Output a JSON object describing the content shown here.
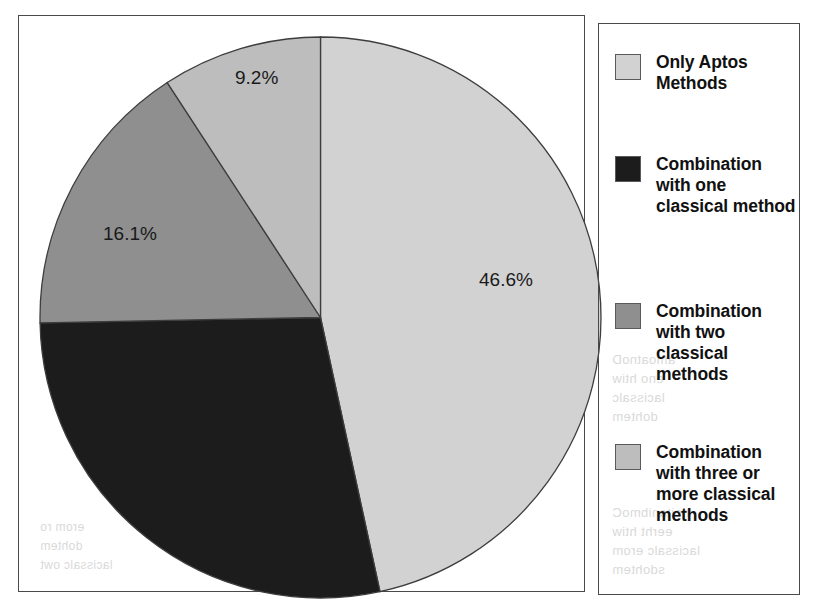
{
  "chart_data": {
    "type": "pie",
    "title": "",
    "subtitle": "",
    "xlabel": "",
    "ylabel": "",
    "grid": false,
    "legend_position": "right",
    "start_angle_deg": 0,
    "direction": "clockwise",
    "categories": [
      "Only Aptos Methods",
      "Combination with one classical method",
      "Combination with two classical methods",
      "Combination with three or more classical methods"
    ],
    "values": [
      46.6,
      28.1,
      16.1,
      9.2
    ],
    "value_labels": [
      "46.6%",
      "28.1%",
      "16.1%",
      "9.2%"
    ],
    "visible_value_labels": [
      "46.6%",
      "16.1%",
      "9.2%"
    ],
    "colors": [
      "#d2d2d2",
      "#1c1c1c",
      "#8f8f8f",
      "#bdbdbd"
    ],
    "units": "percent"
  },
  "pie": {
    "slices": [
      {
        "name": "only-aptos-methods",
        "label": "46.6%",
        "value": 46.6,
        "color": "#d2d2d2",
        "label_x": 460,
        "label_y": 253
      },
      {
        "name": "combination-one-classical",
        "label": "",
        "value": 28.1,
        "color": "#1c1c1c",
        "label_x": 0,
        "label_y": 0
      },
      {
        "name": "combination-two-classical",
        "label": "16.1%",
        "value": 16.1,
        "color": "#8f8f8f",
        "label_x": 84,
        "label_y": 207
      },
      {
        "name": "combination-three-or-more-classical",
        "label": "9.2%",
        "value": 9.2,
        "color": "#bdbdbd",
        "label_x": 216,
        "label_y": 51
      }
    ],
    "outline_color": "#3d3d3d"
  },
  "legend": {
    "items": [
      {
        "label": "Only Aptos Methods",
        "color": "#d2d2d2",
        "top": 28
      },
      {
        "label": "Combination with one classical method",
        "color": "#1c1c1c",
        "top": 130
      },
      {
        "label": "Combination with two classical methods",
        "color": "#8f8f8f",
        "top": 277
      },
      {
        "label": "Combination with three or more classical methods",
        "color": "#bdbdbd",
        "top": 418
      }
    ]
  },
  "background_bleed": [
    {
      "text": "amoatnoD",
      "x": 612,
      "y": 352,
      "size": 13
    },
    {
      "text": "eno htiw",
      "x": 612,
      "y": 371,
      "size": 13
    },
    {
      "text": "lacissalc",
      "x": 612,
      "y": 390,
      "size": 13
    },
    {
      "text": "dohtem",
      "x": 612,
      "y": 409,
      "size": 13
    },
    {
      "text": "noitanibmoC",
      "x": 612,
      "y": 505,
      "size": 13
    },
    {
      "text": "eerht htiw",
      "x": 612,
      "y": 524,
      "size": 13
    },
    {
      "text": "lacissalc erom",
      "x": 612,
      "y": 543,
      "size": 13
    },
    {
      "text": "sdohtem",
      "x": 612,
      "y": 562,
      "size": 13
    },
    {
      "text": "erom ro",
      "x": 40,
      "y": 520,
      "size": 12
    },
    {
      "text": "dohtem",
      "x": 40,
      "y": 539,
      "size": 12
    },
    {
      "text": "lacissalc owt",
      "x": 40,
      "y": 558,
      "size": 12
    },
    {
      "text": "lacissalc eerht",
      "x": 95,
      "y": 392,
      "size": 12
    },
    {
      "text": "sdohtem erom ro",
      "x": 95,
      "y": 411,
      "size": 12
    }
  ]
}
